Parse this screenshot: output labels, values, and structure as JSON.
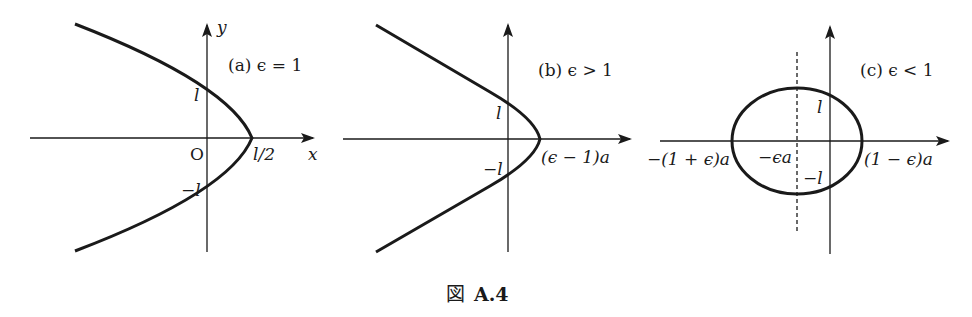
{
  "figure": {
    "caption_prefix": "図",
    "caption_number": "A.4",
    "panels": [
      {
        "id": "a",
        "title": "(a) ϵ = 1",
        "curve": "parabola",
        "axis_x_label": "x",
        "axis_y_label": "y",
        "origin_label": "O",
        "labels": {
          "y_pos": "l",
          "y_neg": "−l",
          "vertex": "l/2"
        }
      },
      {
        "id": "b",
        "title": "(b) ϵ > 1",
        "curve": "hyperbola",
        "labels": {
          "y_pos": "l",
          "y_neg": "−l",
          "vertex": "(ϵ − 1)a"
        }
      },
      {
        "id": "c",
        "title": "(c) ϵ < 1",
        "curve": "ellipse",
        "labels": {
          "y_pos": "l",
          "y_neg": "−l",
          "left_vertex": "−(1 + ϵ)a",
          "center": "−ϵa",
          "right_vertex": "(1 − ϵ)a"
        }
      }
    ]
  },
  "colors": {
    "ink": "#1a1a1a",
    "background": "#ffffff"
  }
}
